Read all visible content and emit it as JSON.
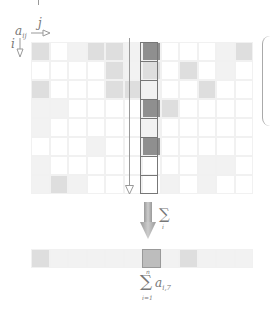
{
  "diagram": {
    "element_label": "a",
    "element_subscript": "ij",
    "col_index_label": "j",
    "row_index_label": "i",
    "sum_operator_label": "∑",
    "sum_operator_sub": "i",
    "result_formula": {
      "operator": "∑",
      "upper": "n",
      "lower": "i=1",
      "term": "a",
      "term_subscript": "i,7"
    },
    "grid": {
      "rows": 8,
      "cols": 12,
      "highlight_col": 6,
      "shades": [
        [
          2,
          0,
          1,
          2,
          2,
          1,
          4,
          0,
          0,
          0,
          1,
          2
        ],
        [
          0,
          0,
          0,
          0,
          2,
          1,
          2,
          0,
          2,
          0,
          1,
          0
        ],
        [
          2,
          0,
          0,
          0,
          2,
          2,
          1,
          0,
          0,
          2,
          0,
          0
        ],
        [
          1,
          1,
          0,
          0,
          0,
          0,
          4,
          2,
          0,
          0,
          0,
          0
        ],
        [
          1,
          0,
          0,
          0,
          0,
          0,
          1,
          0,
          0,
          0,
          0,
          0
        ],
        [
          0,
          0,
          0,
          1,
          0,
          0,
          4,
          0,
          0,
          0,
          0,
          0
        ],
        [
          1,
          0,
          0,
          0,
          0,
          0,
          0,
          0,
          0,
          1,
          1,
          0
        ],
        [
          1,
          2,
          1,
          0,
          0,
          0,
          0,
          1,
          0,
          1,
          0,
          0
        ]
      ]
    },
    "result_row": [
      2,
      1,
      1,
      1,
      1,
      1,
      3,
      1,
      2,
      1,
      1,
      1
    ],
    "colors": {
      "dark": "#8f8f8f",
      "medium": "#bdbdbd",
      "light": "#dedede",
      "very_light": "#f2f2f2",
      "outline": "#777777"
    }
  }
}
